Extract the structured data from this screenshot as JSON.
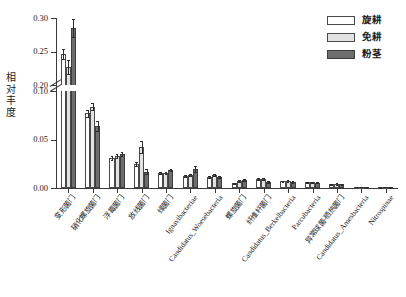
{
  "chart_data": {
    "type": "bar",
    "title": "",
    "subtitle": "",
    "xlabel": "",
    "ylabel": "相对丰度",
    "ylim": [
      0.0,
      0.3
    ],
    "axis_break": {
      "lower_max": 0.1,
      "upper_min": 0.2
    },
    "grid": false,
    "legend_position": "top-right",
    "ytick_labels": [
      "0.00",
      "0.05",
      "0.10",
      "0.20",
      "0.25",
      "0.30"
    ],
    "ytick_values": [
      0.0,
      0.05,
      0.1,
      0.2,
      0.25,
      0.3
    ],
    "categories": [
      "变形菌门",
      "硝化螺旋菌门",
      "浮霉菌门",
      "放线菌门",
      "绿菌门",
      "Ignavibacteriae",
      "Candidatus_Woesebacteria",
      "螺旋菌门",
      "纤维杆菌门",
      "Candidatus_Berkelbacteria",
      "Parcubacteria",
      "异常球菌-栖热菌门",
      "Candidatus_Amesbacteria",
      "Nitrospinae"
    ],
    "series": [
      {
        "name": "旋耕",
        "color": "#ffffff",
        "values": [
          0.2465,
          0.077,
          0.0305,
          0.025,
          0.0155,
          0.0125,
          0.011,
          0.0048,
          0.0095,
          0.0068,
          0.0058,
          0.004,
          0.001,
          0.0008
        ],
        "errors": [
          0.0075,
          0.0035,
          0.002,
          0.002,
          0.0013,
          0.0012,
          0.001,
          0.0008,
          0.001,
          0.0008,
          0.0007,
          0.0006,
          0.0004,
          0.0003
        ]
      },
      {
        "name": "免耕",
        "color": "#e2e2e2",
        "values": [
          0.227,
          0.084,
          0.033,
          0.042,
          0.0152,
          0.013,
          0.0135,
          0.0075,
          0.009,
          0.007,
          0.006,
          0.0042,
          0.0011,
          0.0009
        ],
        "errors": [
          0.011,
          0.004,
          0.0022,
          0.006,
          0.0012,
          0.0011,
          0.0012,
          0.0009,
          0.0009,
          0.0008,
          0.0007,
          0.0006,
          0.0004,
          0.0003
        ]
      },
      {
        "name": "粉茎",
        "color": "#6e6e6e",
        "values": [
          0.285,
          0.064,
          0.035,
          0.017,
          0.0185,
          0.0195,
          0.0115,
          0.0082,
          0.006,
          0.0062,
          0.0055,
          0.0038,
          0.001,
          0.0008
        ],
        "errors": [
          0.0135,
          0.0055,
          0.0022,
          0.0022,
          0.0014,
          0.0035,
          0.001,
          0.0009,
          0.0008,
          0.0008,
          0.0007,
          0.0006,
          0.0004,
          0.0003
        ]
      }
    ]
  },
  "legend": {
    "items": [
      {
        "label": "旋耕",
        "swatch": "s0"
      },
      {
        "label": "免耕",
        "swatch": "s1"
      },
      {
        "label": "粉茎",
        "swatch": "s2"
      }
    ]
  }
}
